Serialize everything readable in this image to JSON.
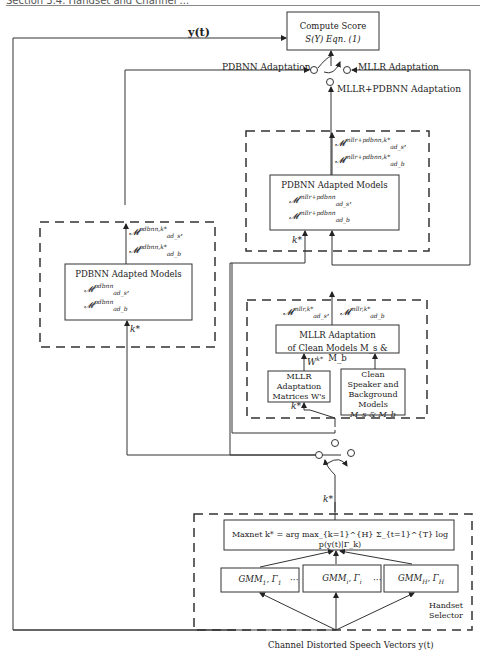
{
  "header": {
    "section": "Section 3.4.   Handset and Channel ..."
  },
  "score_box": {
    "line1": "Compute Score",
    "line2": "S(Y)  Eqn. (1)"
  },
  "input_label": "y(t)",
  "switch_labels": {
    "pdbnn": "PDBNN Adaptation",
    "mllr": "MLLR Adaptation",
    "mllr_pdbnn": "MLLR+PDBNN Adaptation"
  },
  "mllr_pdbnn_block": {
    "output_s": "ad_s",
    "output_s_sup": "mllr+pdbnn,k*",
    "output_b": "ad_b",
    "output_b_sup": "mllr+pdbnn,k*",
    "box_title": "PDBNN Adapted Models",
    "model_s_sup": "mllr+pdbnn",
    "model_s_sub": "ad_s",
    "model_b_sup": "mllr+pdbnn",
    "model_b_sub": "ad_b",
    "k_label": "k*"
  },
  "pdbnn_block": {
    "output_s_sup": "pdbnn,k*",
    "output_s_sub": "ad_s",
    "output_b_sup": "pdbnn,k*",
    "output_b_sub": "ad_b",
    "box_title": "PDBNN Adapted Models",
    "model_s_sup": "pdbnn",
    "model_s_sub": "ad_s",
    "model_b_sup": "pdbnn",
    "model_b_sub": "ad_b",
    "k_label": "k*"
  },
  "mllr_block": {
    "output_s_sup": "mllr,k*",
    "output_s_sub": "ad_s",
    "output_b_sup": "mllr,k*",
    "output_b_sub": "ad_b",
    "adapt_box_line1": "MLLR Adaptation",
    "adapt_box_line2": "of Clean Models M_s & M_b",
    "w_label": "W",
    "w_sup": "k*",
    "matrices_box": [
      "MLLR",
      "Adaptation",
      "Matrices W's"
    ],
    "clean_box": [
      "Clean",
      "Speaker and",
      "Background",
      "Models",
      "M_s & M_b"
    ],
    "k_label": "k*"
  },
  "selector_k_label": "k*",
  "handset_selector": {
    "maxnet": "Maxnet  k* = arg max_{k=1}^{H} Σ_{t=1}^{T} log p(y(t)|Γ_k)",
    "gmms": [
      {
        "name": "GMM",
        "sub": "1",
        "gamma_sub": "1"
      },
      {
        "name": "GMM",
        "sub": "i",
        "gamma_sub": "i"
      },
      {
        "name": "GMM",
        "sub": "H",
        "gamma_sub": "H"
      }
    ],
    "ellipsis": "···",
    "label_line1": "Handset",
    "label_line2": "Selector"
  },
  "bottom_label": "Channel Distorted Speech Vectors y(t)"
}
